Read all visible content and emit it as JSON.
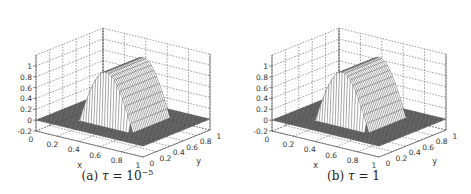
{
  "chart_data": [
    {
      "type": "surface3d",
      "title": "",
      "caption": {
        "label": "(a)",
        "symbol": "τ",
        "eq": "=",
        "base": "10",
        "exponent": "−5"
      },
      "xlabel": "x",
      "ylabel": "y",
      "zlabel": "",
      "xlim": [
        0,
        1
      ],
      "ylim": [
        0,
        1
      ],
      "zlim": [
        -0.2,
        1.2
      ],
      "xticks": [
        "0",
        "0.2",
        "0.4",
        "0.6",
        "0.8",
        "1"
      ],
      "yticks": [
        "0",
        "0.2",
        "0.4",
        "0.6",
        "0.8",
        "1"
      ],
      "zticks": [
        "-0.2",
        "0",
        "0.2",
        "0.4",
        "0.6",
        "0.8",
        "1"
      ],
      "grid": true,
      "surface": {
        "support_x": [
          0.25,
          0.75
        ],
        "support_y": [
          0.25,
          0.8
        ],
        "peak": 1.0,
        "shape": "sin-profile ridge along y",
        "floor": 0
      }
    },
    {
      "type": "surface3d",
      "title": "",
      "caption": {
        "label": "(b)",
        "symbol": "τ",
        "eq": "=",
        "base": "1",
        "exponent": ""
      },
      "xlabel": "x",
      "ylabel": "y",
      "zlabel": "",
      "xlim": [
        0,
        1
      ],
      "ylim": [
        0,
        1
      ],
      "zlim": [
        -0.2,
        1.2
      ],
      "xticks": [
        "0",
        "0.2",
        "0.4",
        "0.6",
        "0.8",
        "1"
      ],
      "yticks": [
        "0",
        "0.2",
        "0.4",
        "0.6",
        "0.8",
        "1"
      ],
      "zticks": [
        "-0.2",
        "0",
        "0.2",
        "0.4",
        "0.6",
        "0.8",
        "1"
      ],
      "grid": true,
      "surface": {
        "support_x": [
          0.25,
          0.75
        ],
        "support_y": [
          0.25,
          0.8
        ],
        "peak": 1.0,
        "shape": "sin-profile ridge along y",
        "floor": 0
      }
    }
  ],
  "colors": {
    "grid": "#555555",
    "mesh": "#3a3a3a",
    "surface": "#ffffff",
    "text": "#333333"
  }
}
